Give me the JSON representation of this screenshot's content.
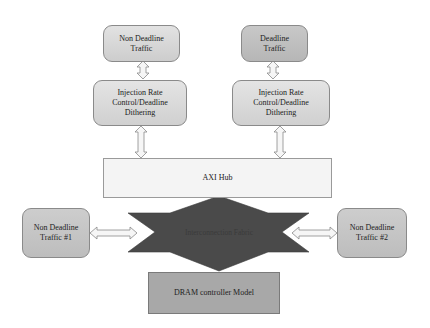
{
  "diagram": {
    "nodes": {
      "non_deadline_traffic": {
        "label": "Non Deadline Traffic"
      },
      "deadline_traffic": {
        "label": "Deadline Traffic"
      },
      "injection_left": {
        "label": "Injection Rate Control/Deadline Dithering"
      },
      "injection_right": {
        "label": "Injection Rate Control/Deadline Dithering"
      },
      "axi_hub": {
        "label": "AXI Hub"
      },
      "interconnection_fabric": {
        "label": "Interconnection Fabric"
      },
      "non_deadline_traffic_1": {
        "label": "Non Deadline Traffic #1"
      },
      "non_deadline_traffic_2": {
        "label": "Non Deadline Traffic #2"
      },
      "dram_controller": {
        "label": "DRAM controller Model"
      }
    },
    "edges": [
      {
        "from": "Non Deadline Traffic",
        "to": "Injection Rate Control/Deadline Dithering (left)",
        "type": "bidirectional"
      },
      {
        "from": "Deadline Traffic",
        "to": "Injection Rate Control/Deadline Dithering (right)",
        "type": "bidirectional"
      },
      {
        "from": "Injection Rate Control/Deadline Dithering (left)",
        "to": "AXI Hub",
        "type": "bidirectional"
      },
      {
        "from": "Injection Rate Control/Deadline Dithering (right)",
        "to": "AXI Hub",
        "type": "bidirectional"
      },
      {
        "from": "Non Deadline Traffic #1",
        "to": "Interconnection Fabric",
        "type": "bidirectional"
      },
      {
        "from": "Non Deadline Traffic #2",
        "to": "Interconnection Fabric",
        "type": "bidirectional"
      }
    ],
    "colors": {
      "box_light": "#d9d9d9",
      "box_dark": "#c4c4c4",
      "hub_fill": "#f4f4f4",
      "fabric_fill": "#4a4a4a",
      "dram_fill": "#a8a8a8",
      "border": "#8a8a8a"
    }
  }
}
